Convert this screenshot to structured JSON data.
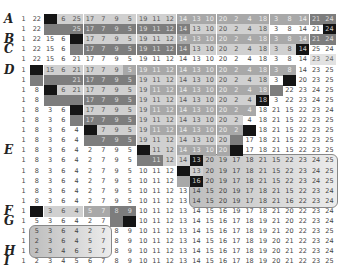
{
  "row_labels": {
    "0": "A",
    "2": "B",
    "3": "C",
    "5": "D",
    "13": "E",
    "19": "F",
    "20": "G",
    "23": "H",
    "24": "I"
  },
  "columns": 24,
  "rows": [
    {
      "v": [
        1,
        22,
        "",
        6,
        25,
        17,
        7,
        9,
        5,
        19,
        11,
        12,
        14,
        13,
        10,
        20,
        2,
        4,
        18,
        3,
        8,
        14,
        21,
        24
      ],
      "s": [
        "",
        "",
        "blk",
        "g1",
        "g1",
        "g1",
        "g1",
        "g1",
        "g1",
        "g1",
        "g1",
        "g1",
        "g2",
        "g2",
        "g2",
        "g2",
        "g2",
        "g2",
        "g2",
        "g2",
        "g2",
        "g2",
        "g3",
        "g3"
      ]
    },
    {
      "v": [
        1,
        22,
        "",
        "",
        25,
        17,
        7,
        9,
        5,
        19,
        11,
        12,
        14,
        13,
        10,
        20,
        2,
        4,
        18,
        3,
        8,
        14,
        21,
        24
      ],
      "s": [
        "",
        "",
        "g3",
        "g3",
        "g3",
        "g3",
        "g3",
        "g3",
        "g3",
        "g3",
        "g3",
        "g3",
        "g3",
        "g1",
        "g1",
        "g1",
        "g1",
        "g1",
        "g1",
        "",
        "",
        "",
        "",
        "blk"
      ]
    },
    {
      "v": [
        1,
        22,
        15,
        6,
        "",
        17,
        7,
        9,
        5,
        19,
        11,
        12,
        14,
        13,
        10,
        20,
        2,
        4,
        18,
        3,
        8,
        14,
        21,
        24
      ],
      "s": [
        "",
        "",
        "",
        "",
        "blk",
        "g1",
        "g1",
        "g1",
        "g1",
        "g1",
        "g1",
        "g1",
        "g2",
        "g2",
        "g2",
        "g2",
        "g2",
        "g2",
        "g2",
        "g2",
        "g2",
        "g2",
        "g3",
        "g3"
      ]
    },
    {
      "v": [
        1,
        22,
        15,
        6,
        "",
        17,
        7,
        9,
        5,
        19,
        11,
        12,
        14,
        13,
        10,
        20,
        2,
        4,
        18,
        3,
        8,
        14,
        25,
        24
      ],
      "s": [
        "",
        "",
        "",
        "",
        "g3",
        "g3",
        "g3",
        "g3",
        "g3",
        "g3",
        "g3",
        "g3",
        "g3",
        "g1",
        "g1",
        "g1",
        "g1",
        "g1",
        "g1",
        "g1",
        "g1",
        "blk",
        "",
        ""
      ]
    },
    {
      "v": [
        1,
        22,
        15,
        6,
        21,
        17,
        7,
        9,
        5,
        19,
        11,
        12,
        14,
        13,
        10,
        20,
        2,
        4,
        18,
        3,
        8,
        14,
        23,
        24
      ],
      "s": [
        "",
        "",
        "",
        "",
        "",
        "",
        "",
        "",
        "",
        "",
        "",
        "",
        "",
        "",
        "",
        "",
        "",
        "",
        "",
        "",
        "",
        "",
        "hl",
        "hl"
      ]
    },
    {
      "v": [
        1,
        "",
        15,
        6,
        21,
        17,
        7,
        9,
        5,
        19,
        11,
        12,
        14,
        13,
        10,
        20,
        2,
        4,
        18,
        3,
        8,
        14,
        23,
        25
      ],
      "s": [
        "",
        "blk",
        "g1",
        "g1",
        "g1",
        "g1",
        "g1",
        "g1",
        "g2",
        "g2",
        "g2",
        "g2",
        "g2",
        "g2",
        "g2",
        "g2",
        "g2",
        "g2",
        "g2",
        "g2",
        "g2",
        "",
        "",
        ""
      ]
    },
    {
      "v": [
        1,
        "",
        "",
        "",
        21,
        17,
        7,
        9,
        5,
        19,
        11,
        12,
        14,
        13,
        10,
        20,
        2,
        4,
        18,
        3,
        "",
        20,
        23,
        25
      ],
      "s": [
        "",
        "g3",
        "g3",
        "g3",
        "g3",
        "g3",
        "g3",
        "g3",
        "g3",
        "g1",
        "g1",
        "g1",
        "g1",
        "g1",
        "g1",
        "g1",
        "g1",
        "g1",
        "g1",
        "",
        "blk",
        "",
        "",
        ""
      ]
    },
    {
      "v": [
        1,
        8,
        "",
        6,
        21,
        17,
        7,
        9,
        5,
        19,
        11,
        12,
        14,
        13,
        10,
        20,
        2,
        4,
        18,
        "",
        22,
        23,
        24,
        25
      ],
      "s": [
        "",
        "",
        "blk",
        "g1",
        "g1",
        "g1",
        "g1",
        "g1",
        "g1",
        "g1",
        "g2",
        "g2",
        "g2",
        "g2",
        "g2",
        "g2",
        "g2",
        "g2",
        "g2",
        "g3",
        "",
        "",
        "",
        ""
      ]
    },
    {
      "v": [
        1,
        8,
        "",
        "",
        "",
        17,
        7,
        9,
        5,
        19,
        11,
        12,
        14,
        13,
        10,
        20,
        2,
        4,
        18,
        3,
        22,
        23,
        24,
        25
      ],
      "s": [
        "",
        "",
        "g3",
        "g3",
        "g3",
        "g3",
        "g3",
        "g3",
        "g3",
        "g1",
        "g1",
        "g1",
        "g1",
        "g1",
        "g1",
        "g1",
        "g1",
        "g1",
        "blk",
        "",
        "",
        "",
        "",
        ""
      ]
    },
    {
      "v": [
        1,
        8,
        3,
        6,
        "",
        17,
        7,
        9,
        5,
        19,
        11,
        12,
        14,
        13,
        10,
        20,
        2,
        4,
        18,
        21,
        15,
        22,
        23,
        24
      ],
      "s": [
        "",
        "",
        "",
        "",
        "blk",
        "g1",
        "g1",
        "g1",
        "g1",
        "g1",
        "g2",
        "g2",
        "g2",
        "g2",
        "g2",
        "g2",
        "g2",
        "g2",
        "",
        "",
        "",
        "",
        "",
        ""
      ]
    },
    {
      "v": [
        1,
        8,
        3,
        6,
        "",
        17,
        7,
        9,
        5,
        19,
        11,
        12,
        14,
        13,
        10,
        20,
        2,
        4,
        18,
        21,
        15,
        22,
        23,
        25
      ],
      "s": [
        "",
        "",
        "",
        "",
        "g3",
        "g3",
        "g3",
        "g3",
        "g3",
        "g1",
        "g1",
        "g1",
        "g1",
        "g1",
        "g1",
        "g1",
        "g1",
        "",
        "",
        "",
        "",
        "",
        "",
        ""
      ]
    },
    {
      "v": [
        1,
        8,
        3,
        6,
        4,
        "",
        7,
        9,
        5,
        19,
        11,
        12,
        14,
        13,
        10,
        20,
        2,
        "",
        18,
        21,
        15,
        22,
        23,
        25
      ],
      "s": [
        "",
        "",
        "",
        "",
        "",
        "blk",
        "g1",
        "g1",
        "g1",
        "g1",
        "g2",
        "g2",
        "g2",
        "g2",
        "g2",
        "g2",
        "g2",
        "blk",
        "",
        "",
        "",
        "",
        "",
        ""
      ]
    },
    {
      "v": [
        1,
        8,
        3,
        6,
        4,
        "",
        7,
        9,
        5,
        19,
        11,
        12,
        14,
        13,
        10,
        20,
        "",
        17,
        18,
        21,
        15,
        22,
        23,
        25
      ],
      "s": [
        "",
        "",
        "",
        "",
        "",
        "g3",
        "g3",
        "g3",
        "g3",
        "g1",
        "g1",
        "g1",
        "g1",
        "g1",
        "g1",
        "g1",
        "g3",
        "",
        "",
        "",
        "",
        "",
        "",
        ""
      ]
    },
    {
      "v": [
        1,
        8,
        3,
        6,
        4,
        2,
        7,
        9,
        5,
        "",
        11,
        12,
        14,
        13,
        10,
        20,
        "",
        17,
        18,
        21,
        15,
        22,
        23,
        25
      ],
      "s": [
        "",
        "",
        "",
        "",
        "",
        "",
        "",
        "",
        "",
        "blk",
        "g1",
        "g1",
        "g2",
        "g2",
        "g2",
        "g2",
        "blk",
        "",
        "",
        "",
        "",
        "",
        "",
        ""
      ]
    },
    {
      "v": [
        1,
        8,
        3,
        6,
        4,
        2,
        7,
        9,
        5,
        "",
        11,
        12,
        14,
        13,
        20,
        19,
        17,
        18,
        21,
        15,
        22,
        23,
        24,
        25
      ],
      "s": [
        "",
        "",
        "",
        "",
        "",
        "",
        "",
        "",
        "",
        "g3",
        "g3",
        "g1",
        "g1",
        "blk",
        "",
        "",
        "",
        "",
        "",
        "",
        "",
        "",
        "",
        ""
      ]
    },
    {
      "v": [
        1,
        8,
        3,
        6,
        4,
        2,
        7,
        9,
        5,
        10,
        11,
        12,
        "",
        13,
        20,
        19,
        17,
        18,
        21,
        15,
        22,
        23,
        24,
        25
      ],
      "s": [
        "",
        "",
        "",
        "",
        "",
        "",
        "",
        "",
        "",
        "",
        "",
        "",
        "blk",
        "g1",
        "",
        "",
        "",
        "",
        "",
        "",
        "",
        "",
        "",
        ""
      ]
    },
    {
      "v": [
        1,
        8,
        3,
        6,
        4,
        2,
        7,
        9,
        5,
        10,
        11,
        12,
        "",
        16,
        20,
        19,
        17,
        18,
        21,
        15,
        22,
        23,
        24,
        25
      ],
      "s": [
        "",
        "",
        "",
        "",
        "",
        "",
        "",
        "",
        "",
        "",
        "",
        "",
        "g2",
        "blk",
        "",
        "",
        "",
        "",
        "",
        "",
        "",
        "",
        "",
        ""
      ]
    },
    {
      "v": [
        1,
        8,
        3,
        6,
        4,
        2,
        7,
        9,
        5,
        10,
        11,
        12,
        13,
        14,
        15,
        20,
        19,
        17,
        18,
        21,
        15,
        22,
        23,
        24
      ],
      "s": [
        "",
        "",
        "",
        "",
        "",
        "",
        "",
        "",
        "",
        "",
        "",
        "",
        "",
        "",
        "",
        "",
        "",
        "",
        "",
        "",
        "",
        "",
        "",
        ""
      ]
    },
    {
      "v": [
        1,
        8,
        3,
        6,
        4,
        2,
        7,
        9,
        5,
        10,
        11,
        12,
        13,
        14,
        15,
        20,
        19,
        17,
        18,
        21,
        16,
        22,
        23,
        24
      ],
      "s": [
        "",
        "",
        "",
        "",
        "",
        "",
        "",
        "",
        "",
        "",
        "",
        "",
        "",
        "",
        "",
        "",
        "",
        "",
        "",
        "",
        "",
        "",
        "",
        ""
      ]
    },
    {
      "v": [
        1,
        "",
        3,
        6,
        4,
        5,
        7,
        8,
        9,
        10,
        11,
        12,
        13,
        14,
        15,
        16,
        19,
        17,
        18,
        21,
        20,
        22,
        23,
        24
      ],
      "s": [
        "",
        "blk",
        "g1",
        "g1",
        "g1",
        "g2",
        "g2",
        "g3",
        "g3",
        "",
        "",
        "",
        "",
        "",
        "",
        "",
        "",
        "",
        "",
        "",
        "",
        "",
        "",
        ""
      ]
    },
    {
      "v": [
        1,
        5,
        3,
        6,
        4,
        2,
        7,
        "",
        "",
        10,
        11,
        12,
        13,
        14,
        15,
        16,
        17,
        18,
        19,
        21,
        20,
        22,
        23,
        24
      ],
      "s": [
        "",
        "",
        "",
        "",
        "",
        "",
        "",
        "g3",
        "blk",
        "",
        "",
        "",
        "",
        "",
        "",
        "",
        "",
        "",
        "",
        "",
        "",
        "",
        "",
        ""
      ]
    },
    {
      "v": [
        1,
        5,
        3,
        6,
        4,
        2,
        7,
        8,
        9,
        10,
        11,
        12,
        13,
        14,
        15,
        16,
        17,
        18,
        19,
        21,
        20,
        22,
        23,
        25
      ],
      "s": [
        "",
        "",
        "",
        "",
        "",
        "",
        "",
        "",
        "",
        "",
        "",
        "",
        "",
        "",
        "",
        "",
        "",
        "",
        "",
        "",
        "",
        "",
        "",
        ""
      ]
    },
    {
      "v": [
        1,
        2,
        3,
        6,
        4,
        5,
        7,
        8,
        9,
        10,
        11,
        12,
        13,
        14,
        15,
        16,
        17,
        18,
        19,
        20,
        21,
        22,
        23,
        24
      ],
      "s": [
        "",
        "",
        "",
        "",
        "",
        "",
        "",
        "",
        "",
        "",
        "",
        "",
        "",
        "",
        "",
        "",
        "",
        "",
        "",
        "",
        "",
        "",
        "",
        ""
      ]
    },
    {
      "v": [
        1,
        2,
        3,
        4,
        6,
        5,
        7,
        8,
        9,
        10,
        11,
        12,
        13,
        14,
        15,
        16,
        17,
        18,
        19,
        20,
        21,
        22,
        23,
        24
      ],
      "s": [
        "",
        "",
        "",
        "",
        "",
        "",
        "",
        "",
        "",
        "",
        "",
        "",
        "",
        "",
        "",
        "",
        "",
        "",
        "",
        "",
        "",
        "",
        "",
        ""
      ]
    },
    {
      "v": [
        1,
        2,
        3,
        4,
        5,
        6,
        7,
        8,
        9,
        10,
        11,
        12,
        13,
        14,
        15,
        16,
        17,
        18,
        19,
        20,
        21,
        22,
        23,
        25
      ],
      "s": [
        "",
        "",
        "",
        "",
        "",
        "",
        "",
        "",
        "",
        "",
        "",
        "",
        "",
        "",
        "",
        "",
        "",
        "",
        "",
        "",
        "",
        "",
        "",
        ""
      ]
    }
  ],
  "highlight_boxes": [
    {
      "name": "region-e-box",
      "row_start": 14,
      "row_end": 18,
      "col_start": 13,
      "col_end": 23
    },
    {
      "name": "region-h-box",
      "row_start": 21,
      "row_end": 23,
      "col_start": 1,
      "col_end": 6
    }
  ]
}
